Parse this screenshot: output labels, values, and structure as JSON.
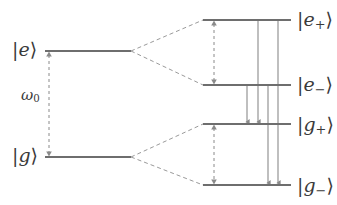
{
  "figure": {
    "name": "dressed-state-energy-level-diagram",
    "background_color": "#ffffff",
    "level_color": "#6e6e6e",
    "fan_color": "#9a9a9a",
    "arrow_color": "#8a8a8a",
    "text_color": "#3a3a3a"
  },
  "bare_levels": [
    {
      "id": "e",
      "ket_open": "|",
      "symbol": "e",
      "sub": "",
      "ket_close": "⟩",
      "label": "|e⟩",
      "x1": 45,
      "x2": 131,
      "y": 51,
      "label_x": 12,
      "label_y": 51
    },
    {
      "id": "g",
      "ket_open": "|",
      "symbol": "g",
      "sub": "",
      "ket_close": "⟩",
      "label": "|g⟩",
      "x1": 45,
      "x2": 131,
      "y": 157,
      "label_x": 12,
      "label_y": 157
    }
  ],
  "dressed_levels": [
    {
      "id": "e_plus",
      "ket_open": "|",
      "symbol": "e",
      "sub": "+",
      "ket_close": "⟩",
      "label": "|e₊⟩",
      "x1": 203,
      "x2": 291,
      "y": 20,
      "label_x": 297,
      "label_y": 21
    },
    {
      "id": "e_minus",
      "ket_open": "|",
      "symbol": "e",
      "sub": "−",
      "ket_close": "⟩",
      "label": "|e₋⟩",
      "x1": 203,
      "x2": 291,
      "y": 85,
      "label_x": 297,
      "label_y": 86
    },
    {
      "id": "g_plus",
      "ket_open": "|",
      "symbol": "g",
      "sub": "+",
      "ket_close": "⟩",
      "label": "|g₊⟩",
      "x1": 203,
      "x2": 291,
      "y": 124,
      "label_x": 297,
      "label_y": 126
    },
    {
      "id": "g_minus",
      "ket_open": "|",
      "symbol": "g",
      "sub": "−",
      "ket_close": "⟩",
      "label": "|g₋⟩",
      "x1": 203,
      "x2": 291,
      "y": 185,
      "label_x": 297,
      "label_y": 187
    }
  ],
  "fan_connectors": [
    {
      "id": "e-to-e-plus",
      "from_x": 131,
      "from_y": 51,
      "to_x": 203,
      "to_y": 20
    },
    {
      "id": "e-to-e-minus",
      "from_x": 131,
      "from_y": 51,
      "to_x": 203,
      "to_y": 85
    },
    {
      "id": "g-to-g-plus",
      "from_x": 131,
      "from_y": 157,
      "to_x": 203,
      "to_y": 124
    },
    {
      "id": "g-to-g-minus",
      "from_x": 131,
      "from_y": 157,
      "to_x": 203,
      "to_y": 185
    }
  ],
  "dashed_arrows": [
    {
      "id": "omega0-splitting-arrow",
      "x": 49,
      "y_top": 51,
      "y_bottom": 157,
      "label": "ω",
      "label_sub": "0",
      "label_x": 30,
      "label_y": 96
    },
    {
      "id": "excited-doublet-arrow",
      "x": 214,
      "y_top": 20,
      "y_bottom": 85,
      "label": "",
      "label_sub": "",
      "label_x": null,
      "label_y": null
    },
    {
      "id": "ground-doublet-arrow",
      "x": 214,
      "y_top": 124,
      "y_bottom": 185,
      "label": "",
      "label_sub": "",
      "label_x": null,
      "label_y": null
    }
  ],
  "transition_arrows": [
    {
      "id": "transition-e-minus-to-g-plus",
      "x": 247,
      "y_from": 85,
      "y_to": 124
    },
    {
      "id": "transition-e-plus-to-g-plus",
      "x": 258,
      "y_from": 20,
      "y_to": 124
    },
    {
      "id": "transition-e-minus-to-g-minus",
      "x": 268,
      "y_from": 85,
      "y_to": 185
    },
    {
      "id": "transition-e-plus-to-g-minus",
      "x": 278,
      "y_from": 20,
      "y_to": 185
    }
  ],
  "omega": {
    "symbol": "ω",
    "subscript": "0",
    "full": "ω₀"
  }
}
